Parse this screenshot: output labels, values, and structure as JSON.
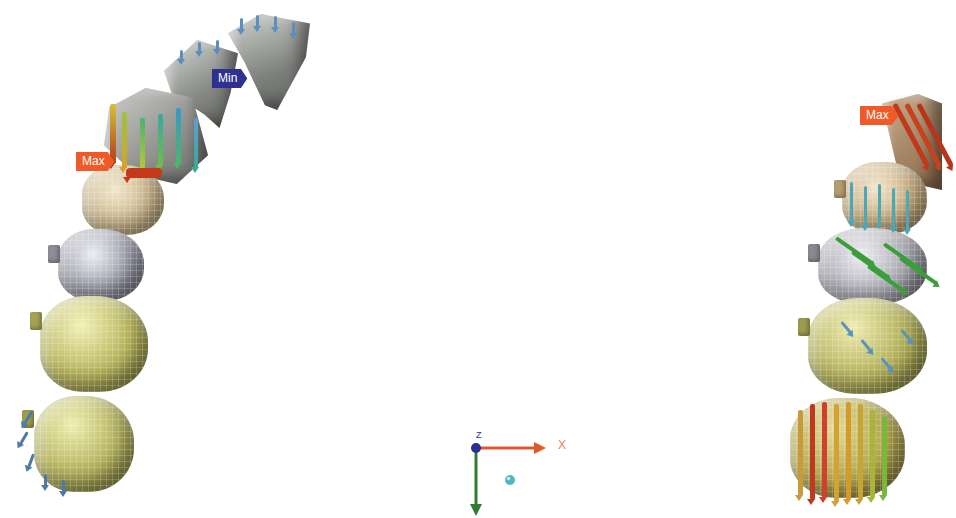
{
  "scene": {
    "left_model": {
      "labels": {
        "max": "Max",
        "min": "Min"
      },
      "max_label_pos": {
        "x": 76,
        "y": 152
      },
      "min_label_pos": {
        "x": 212,
        "y": 69
      }
    },
    "right_model": {
      "labels": {
        "max": "Max"
      },
      "max_label_pos": {
        "x": 860,
        "y": 106
      }
    },
    "colors": {
      "max_tag": "#f05a28",
      "min_tag": "#2e3192",
      "tooth_beige": "#c9b58a",
      "tooth_silver": "#9a9aa6",
      "tooth_olive": "#b5b35a",
      "incisor_gray": "#8d8f8c",
      "vector_blue": "#5aa0c8",
      "vector_green": "#3aa83a",
      "vector_red": "#c8361a",
      "vector_orange": "#d89a2a"
    },
    "axis_triad": {
      "x_label": "X",
      "z_label": "Z",
      "x_color": "#e0572a",
      "y_color": "#2f7d32",
      "z_color": "#2b2f8f",
      "origin_marker_color": "#4fb8c0"
    }
  }
}
